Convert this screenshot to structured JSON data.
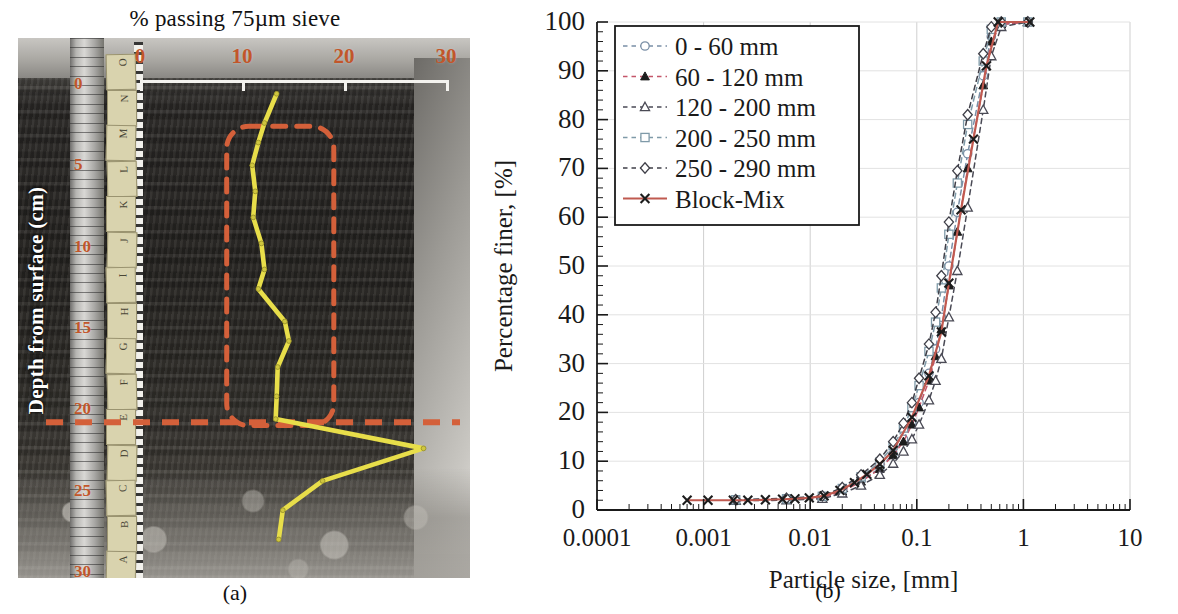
{
  "figure": {
    "panel_a": {
      "caption": "(a)",
      "title": "% passing 75µm sieve",
      "x_axis_label": "% passing 75µm sieve",
      "x_ticks": [
        "0",
        "10",
        "20",
        "30"
      ],
      "y_axis_label": "Depth from surface (cm)",
      "y_ticks": [
        "0",
        "5",
        "10",
        "15",
        "20",
        "25",
        "30"
      ],
      "sample_tags": [
        "O",
        "N",
        "M",
        "L",
        "K",
        "J",
        "I",
        "H",
        "G",
        "F",
        "E",
        "D",
        "C",
        "B",
        "A"
      ],
      "curve_color": "#e8de4a",
      "annotation_color": "#d4603a",
      "profile": {
        "name": "% passing 75µm sieve vs depth",
        "points": [
          {
            "depth_cm": 0.6,
            "passing_pct": 13.4
          },
          {
            "depth_cm": 2.4,
            "passing_pct": 12.2
          },
          {
            "depth_cm": 3.6,
            "passing_pct": 11.6
          },
          {
            "depth_cm": 5.0,
            "passing_pct": 11.0
          },
          {
            "depth_cm": 6.6,
            "passing_pct": 11.3
          },
          {
            "depth_cm": 8.2,
            "passing_pct": 11.1
          },
          {
            "depth_cm": 9.8,
            "passing_pct": 11.9
          },
          {
            "depth_cm": 11.4,
            "passing_pct": 12.2
          },
          {
            "depth_cm": 12.6,
            "passing_pct": 11.6
          },
          {
            "depth_cm": 14.6,
            "passing_pct": 14.2
          },
          {
            "depth_cm": 15.8,
            "passing_pct": 14.6
          },
          {
            "depth_cm": 17.4,
            "passing_pct": 13.5
          },
          {
            "depth_cm": 19.2,
            "passing_pct": 13.4
          },
          {
            "depth_cm": 20.6,
            "passing_pct": 13.3
          },
          {
            "depth_cm": 22.4,
            "passing_pct": 27.8
          },
          {
            "depth_cm": 24.4,
            "passing_pct": 17.9
          },
          {
            "depth_cm": 26.2,
            "passing_pct": 14.0
          },
          {
            "depth_cm": 28.0,
            "passing_pct": 13.6
          }
        ]
      },
      "annotations": {
        "zone_box": {
          "depth_from_cm": 2.6,
          "depth_to_cm": 21.0,
          "x_from_pct": 8.5,
          "x_to_pct": 19.0
        },
        "boundary_line_depth_cm": 20.8
      }
    },
    "panel_b": {
      "caption": "(b)",
      "chart_data": {
        "type": "line",
        "title": "",
        "xlabel": "Particle size, [mm]",
        "ylabel": "Percentage  finer,  [%]",
        "xscale": "log",
        "xlim": [
          0.0001,
          10
        ],
        "ylim": [
          0,
          100
        ],
        "xticks": [
          0.0001,
          0.001,
          0.01,
          0.1,
          1,
          10
        ],
        "xtick_labels": [
          "0.0001",
          "0.001",
          "0.01",
          "0.1",
          "1",
          "10"
        ],
        "yticks": [
          0,
          10,
          20,
          30,
          40,
          50,
          60,
          70,
          80,
          90,
          100
        ],
        "ytick_labels": [
          "0",
          "10",
          "20",
          "30",
          "40",
          "50",
          "60",
          "70",
          "80",
          "90",
          "100"
        ],
        "grid": true,
        "legend_position": "upper-left-inside",
        "series": [
          {
            "name": "0 -   60 mm",
            "marker": "circle-open",
            "linestyle": "dashed",
            "color": "#7a8fa6",
            "points": [
              [
                0.002,
                2.0
              ],
              [
                0.006,
                2.2
              ],
              [
                0.013,
                2.6
              ],
              [
                0.02,
                4.0
              ],
              [
                0.03,
                6.0
              ],
              [
                0.045,
                8.6
              ],
              [
                0.06,
                11.5
              ],
              [
                0.075,
                14.5
              ],
              [
                0.09,
                18.0
              ],
              [
                0.105,
                22.0
              ],
              [
                0.13,
                28.0
              ],
              [
                0.15,
                33.0
              ],
              [
                0.17,
                39.5
              ],
              [
                0.2,
                50.0
              ],
              [
                0.24,
                61.0
              ],
              [
                0.3,
                73.0
              ],
              [
                0.42,
                89.0
              ],
              [
                0.5,
                97.0
              ],
              [
                0.62,
                99.5
              ],
              [
                1.1,
                100.0
              ]
            ]
          },
          {
            "name": "60 - 120 mm",
            "marker": "triangle-filled",
            "linestyle": "dashed",
            "color": "#c4566a",
            "points": [
              [
                0.002,
                2.0
              ],
              [
                0.006,
                2.1
              ],
              [
                0.013,
                2.5
              ],
              [
                0.02,
                3.8
              ],
              [
                0.03,
                5.8
              ],
              [
                0.045,
                8.4
              ],
              [
                0.06,
                11.2
              ],
              [
                0.075,
                14.0
              ],
              [
                0.09,
                17.5
              ],
              [
                0.105,
                21.0
              ],
              [
                0.13,
                26.5
              ],
              [
                0.15,
                31.5
              ],
              [
                0.17,
                37.0
              ],
              [
                0.2,
                46.0
              ],
              [
                0.24,
                57.0
              ],
              [
                0.3,
                70.0
              ],
              [
                0.42,
                87.0
              ],
              [
                0.5,
                96.0
              ],
              [
                0.62,
                99.5
              ],
              [
                1.1,
                100.0
              ]
            ]
          },
          {
            "name": "120 - 200 mm",
            "marker": "triangle-open",
            "linestyle": "dashed",
            "color": "#4a4a55",
            "points": [
              [
                0.002,
                1.9
              ],
              [
                0.006,
                2.0
              ],
              [
                0.013,
                2.3
              ],
              [
                0.02,
                3.4
              ],
              [
                0.03,
                5.0
              ],
              [
                0.045,
                7.2
              ],
              [
                0.06,
                9.5
              ],
              [
                0.075,
                12.0
              ],
              [
                0.09,
                14.5
              ],
              [
                0.105,
                17.5
              ],
              [
                0.13,
                22.5
              ],
              [
                0.15,
                26.5
              ],
              [
                0.17,
                31.0
              ],
              [
                0.2,
                39.5
              ],
              [
                0.24,
                49.0
              ],
              [
                0.3,
                62.0
              ],
              [
                0.42,
                82.0
              ],
              [
                0.5,
                93.0
              ],
              [
                0.62,
                99.0
              ],
              [
                1.1,
                100.0
              ]
            ]
          },
          {
            "name": "200 - 250 mm",
            "marker": "square-open",
            "linestyle": "dashed",
            "color": "#7f9aa8",
            "points": [
              [
                0.002,
                2.1
              ],
              [
                0.006,
                2.3
              ],
              [
                0.013,
                2.8
              ],
              [
                0.02,
                4.4
              ],
              [
                0.03,
                6.8
              ],
              [
                0.045,
                9.8
              ],
              [
                0.06,
                13.2
              ],
              [
                0.075,
                16.8
              ],
              [
                0.09,
                21.0
              ],
              [
                0.105,
                25.5
              ],
              [
                0.13,
                32.5
              ],
              [
                0.15,
                38.5
              ],
              [
                0.17,
                45.5
              ],
              [
                0.2,
                56.5
              ],
              [
                0.24,
                67.0
              ],
              [
                0.3,
                79.0
              ],
              [
                0.42,
                92.0
              ],
              [
                0.5,
                98.5
              ],
              [
                0.62,
                100.0
              ],
              [
                1.1,
                100.0
              ]
            ]
          },
          {
            "name": "250 - 290 mm",
            "marker": "diamond-open",
            "linestyle": "dashed",
            "color": "#3f3f48",
            "points": [
              [
                0.002,
                2.1
              ],
              [
                0.006,
                2.4
              ],
              [
                0.013,
                2.9
              ],
              [
                0.02,
                4.6
              ],
              [
                0.03,
                7.2
              ],
              [
                0.045,
                10.4
              ],
              [
                0.06,
                14.0
              ],
              [
                0.075,
                17.8
              ],
              [
                0.09,
                22.0
              ],
              [
                0.105,
                27.0
              ],
              [
                0.13,
                34.0
              ],
              [
                0.15,
                40.5
              ],
              [
                0.17,
                48.0
              ],
              [
                0.2,
                59.0
              ],
              [
                0.24,
                69.5
              ],
              [
                0.3,
                81.0
              ],
              [
                0.42,
                93.5
              ],
              [
                0.5,
                99.0
              ],
              [
                0.62,
                100.0
              ],
              [
                1.1,
                100.0
              ]
            ]
          },
          {
            "name": "Block-Mix",
            "marker": "x-filled",
            "linestyle": "solid",
            "color": "#c05a50",
            "points": [
              [
                0.0007,
                2.0
              ],
              [
                0.0011,
                2.0
              ],
              [
                0.0019,
                2.0
              ],
              [
                0.0026,
                2.0
              ],
              [
                0.0038,
                2.1
              ],
              [
                0.0055,
                2.2
              ],
              [
                0.0072,
                2.3
              ],
              [
                0.0098,
                2.5
              ],
              [
                0.0135,
                2.9
              ],
              [
                0.019,
                4.0
              ],
              [
                0.026,
                5.6
              ],
              [
                0.034,
                7.3
              ],
              [
                0.045,
                9.4
              ],
              [
                0.06,
                12.2
              ],
              [
                0.09,
                19.0
              ],
              [
                0.13,
                27.5
              ],
              [
                0.17,
                36.5
              ],
              [
                0.2,
                46.5
              ],
              [
                0.26,
                61.5
              ],
              [
                0.34,
                76.0
              ],
              [
                0.45,
                91.0
              ],
              [
                0.58,
                100.0
              ],
              [
                1.15,
                100.0
              ]
            ]
          }
        ]
      }
    }
  }
}
